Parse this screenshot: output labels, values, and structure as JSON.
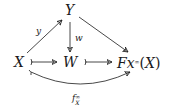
{
  "diagram": {
    "type": "commutative-diagram",
    "nodes": {
      "Y": "Y",
      "X": "X",
      "W": "W",
      "F": "Fx",
      "F_sup": "∞",
      "F_arg": "(X)"
    },
    "arrows": [
      {
        "from": "X",
        "to": "Y",
        "label": "y",
        "style": "arrow"
      },
      {
        "from": "Y",
        "to": "W",
        "label": "w",
        "style": "arrow"
      },
      {
        "from": "Y",
        "to": "Fx∞(X)",
        "label": "",
        "style": "arrow"
      },
      {
        "from": "X",
        "to": "W",
        "label": "",
        "style": "monomorphism"
      },
      {
        "from": "W",
        "to": "Fx∞(X)",
        "label": "",
        "style": "monomorphism"
      },
      {
        "from": "X",
        "to": "Fx∞(X)",
        "label": "f∞_X",
        "style": "curved-monomorphism"
      }
    ],
    "labels": {
      "y": "y",
      "w": "w",
      "f_base": "f",
      "f_sup": "∞",
      "f_sub": "X"
    },
    "stroke_color": "#1a1a1a"
  }
}
